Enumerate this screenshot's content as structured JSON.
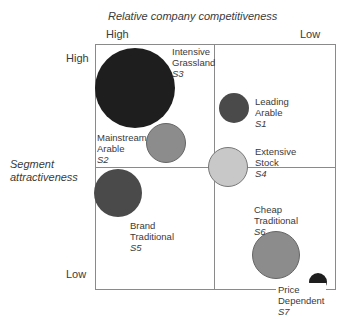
{
  "x_axis": {
    "title": "Relative company competitiveness",
    "high_label": "High",
    "low_label": "Low"
  },
  "y_axis": {
    "title_line1": "Segment",
    "title_line2": "attractiveness",
    "high_label": "High",
    "low_label": "Low"
  },
  "colors": {
    "border": "#8a8a8a",
    "darkest": "#1e1e1e",
    "dark": "#4a4a4a",
    "mid": "#8c8c8c",
    "light": "#c8c8c8"
  },
  "segments": [
    {
      "code": "S1",
      "line1": "Leading",
      "line2": "Arable",
      "cx": 234,
      "cy": 108,
      "r": 15,
      "fill": "#4a4a4a"
    },
    {
      "code": "S2",
      "line1": "Mainstream",
      "line2": "Arable",
      "cx": 166,
      "cy": 143,
      "r": 20,
      "fill": "#8c8c8c"
    },
    {
      "code": "S3",
      "line1": "Intensive",
      "line2": "Grassland",
      "cx": 135,
      "cy": 88,
      "r": 40,
      "fill": "#1e1e1e"
    },
    {
      "code": "S4",
      "line1": "Extensive",
      "line2": "Stock",
      "cx": 228,
      "cy": 167,
      "r": 20,
      "fill": "#c8c8c8"
    },
    {
      "code": "S5",
      "line1": "Brand",
      "line2": "Traditional",
      "cx": 118,
      "cy": 193,
      "r": 24,
      "fill": "#4a4a4a"
    },
    {
      "code": "S6",
      "line1": "Cheap",
      "line2": "Traditional",
      "cx": 276,
      "cy": 255,
      "r": 24,
      "fill": "#8c8c8c"
    },
    {
      "code": "S7",
      "line1": "Price",
      "line2": "Dependent",
      "cx": 318,
      "cy": 282,
      "r": 9,
      "fill": "#1e1e1e"
    }
  ]
}
